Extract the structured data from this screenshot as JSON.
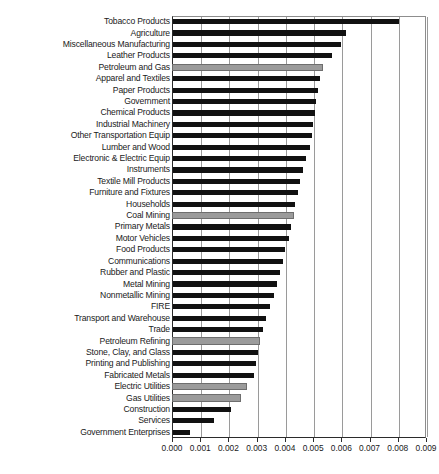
{
  "chart_data": {
    "type": "bar",
    "orientation": "horizontal",
    "title": "",
    "xlabel": "",
    "ylabel": "",
    "xlim": [
      0.0,
      0.009
    ],
    "xticks": [
      "0.000",
      "0.001",
      "0.002",
      "0.003",
      "0.004",
      "0.005",
      "0.006",
      "0.007",
      "0.008",
      "0.009"
    ],
    "xtick_values": [
      0.0,
      0.001,
      0.002,
      0.003,
      0.004,
      0.005,
      0.006,
      0.007,
      0.008,
      0.009
    ],
    "grid": "vertical",
    "legend": "none",
    "series_colors": {
      "primary": "#111111",
      "highlight": "#9b9b9b"
    },
    "categories": [
      "Tobacco Products",
      "Agriculture",
      "Miscellaneous Manufacturing",
      "Leather Products",
      "Petroleum and Gas",
      "Apparel and Textiles",
      "Paper Products",
      "Government",
      "Chemical Products",
      "Industrial Machinery",
      "Other Transportation Equip",
      "Lumber and Wood",
      "Electronic & Electric Equip",
      "Instruments",
      "Textile Mill Products",
      "Furniture and Fixtures",
      "Households",
      "Coal Mining",
      "Primary Metals",
      "Motor Vehicles",
      "Food Products",
      "Communications",
      "Rubber and Plastic",
      "Metal Mining",
      "Nonmetallic Mining",
      "FIRE",
      "Transport and Warehouse",
      "Trade",
      "Petroleum Refining",
      "Stone, Clay, and Glass",
      "Printing and Publishing",
      "Fabricated Metals",
      "Electric Utilities",
      "Gas Utilities",
      "Construction",
      "Services",
      "Government Enterprises"
    ],
    "values": [
      0.008,
      0.00613,
      0.00595,
      0.00564,
      0.00528,
      0.0052,
      0.00514,
      0.00508,
      0.00503,
      0.00497,
      0.00492,
      0.00487,
      0.00473,
      0.0046,
      0.0045,
      0.00444,
      0.00432,
      0.00424,
      0.00418,
      0.0041,
      0.00398,
      0.00388,
      0.0038,
      0.0037,
      0.00358,
      0.00345,
      0.0033,
      0.00318,
      0.00306,
      0.003,
      0.00293,
      0.00286,
      0.0026,
      0.00238,
      0.00205,
      0.00145,
      0.00061
    ],
    "highlighted": [
      "Petroleum and Gas",
      "Coal Mining",
      "Petroleum Refining",
      "Electric Utilities",
      "Gas Utilities"
    ]
  },
  "caption": ""
}
